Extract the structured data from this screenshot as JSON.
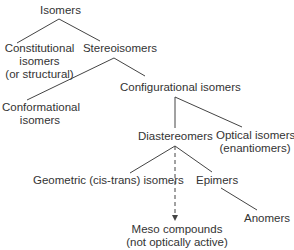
{
  "diagram": {
    "nodes": {
      "isomers": {
        "lines": [
          "Isomers"
        ]
      },
      "constitutional": {
        "lines": [
          "Constitutional",
          "isomers",
          "(or structural)"
        ]
      },
      "stereoisomers": {
        "lines": [
          "Stereoisomers"
        ]
      },
      "conformational": {
        "lines": [
          "Conformational",
          "isomers"
        ]
      },
      "configurational": {
        "lines": [
          "Configurational isomers"
        ]
      },
      "diastereomers": {
        "lines": [
          "Diastereomers"
        ]
      },
      "optical": {
        "lines": [
          "Optical isomers",
          "(enantiomers)"
        ]
      },
      "geometric": {
        "lines": [
          "Geometric (cis-trans) isomers"
        ]
      },
      "epimers": {
        "lines": [
          "Epimers"
        ]
      },
      "meso": {
        "lines": [
          "Meso compounds",
          "(not optically active)"
        ]
      },
      "anomers": {
        "lines": [
          "Anomers"
        ]
      }
    },
    "edges": [
      {
        "from": "isomers",
        "to": "constitutional",
        "style": "solid"
      },
      {
        "from": "isomers",
        "to": "stereoisomers",
        "style": "solid"
      },
      {
        "from": "stereoisomers",
        "to": "conformational",
        "style": "solid"
      },
      {
        "from": "stereoisomers",
        "to": "configurational",
        "style": "solid"
      },
      {
        "from": "configurational",
        "to": "diastereomers",
        "style": "solid"
      },
      {
        "from": "configurational",
        "to": "optical",
        "style": "solid"
      },
      {
        "from": "diastereomers",
        "to": "geometric",
        "style": "solid"
      },
      {
        "from": "diastereomers",
        "to": "epimers",
        "style": "solid"
      },
      {
        "from": "diastereomers",
        "to": "meso",
        "style": "dashed-arrow"
      },
      {
        "from": "epimers",
        "to": "anomers",
        "style": "solid"
      }
    ],
    "colors": {
      "text": "#333333",
      "line": "#444444",
      "background": "#ffffff"
    }
  }
}
